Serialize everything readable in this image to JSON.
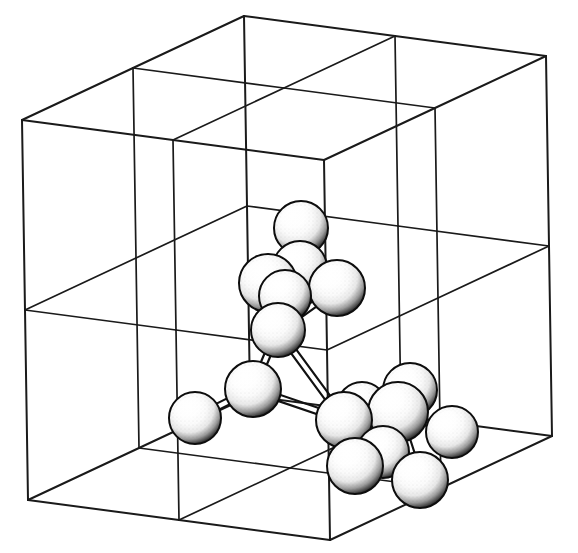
{
  "figure": {
    "kind": "crystal-lattice-illustration",
    "style": "hand-drawn line art, black ink on white",
    "background_color": "#ffffff",
    "ink_color": "#1a1a1a",
    "atom_fill_color": "#ffffff",
    "atom_shade_color": "#1b1b1b",
    "bond_color": "#111111"
  },
  "unit_cell": {
    "name": "subdivided-cube",
    "projection": "oblique-parallel",
    "subdivisions_per_edge": 2,
    "edge_stroke_width_outer": 2.0,
    "edge_stroke_width_inner": 1.7,
    "vertices": {
      "front_bottom_left": [
        28,
        500
      ],
      "front_bottom_right": [
        330,
        540
      ],
      "front_top_left": [
        22,
        120
      ],
      "front_top_right": [
        330,
        168
      ],
      "back_bottom_left": [
        250,
        396
      ],
      "back_bottom_right": [
        556,
        434
      ],
      "back_top_left": [
        248,
        27
      ],
      "back_top_right": [
        556,
        53
      ]
    },
    "axis_vectors": {
      "x_right": [
        302,
        40
      ],
      "y_up": [
        6,
        -380
      ],
      "z_depth": [
        222,
        -104
      ]
    }
  },
  "atoms": {
    "count": 16,
    "radius_px": 27,
    "list": [
      {
        "id": "a1",
        "label": "atom-top",
        "cx": 301,
        "cy": 228,
        "r": 27
      },
      {
        "id": "a2",
        "label": "atom-upper-left",
        "cx": 268,
        "cy": 283,
        "r": 29
      },
      {
        "id": "a3",
        "label": "atom-upper-right",
        "cx": 337,
        "cy": 288,
        "r": 28
      },
      {
        "id": "a4",
        "label": "atom-upper-back",
        "cx": 300,
        "cy": 268,
        "r": 27
      },
      {
        "id": "a5",
        "label": "atom-mid-center",
        "cx": 278,
        "cy": 330,
        "r": 27
      },
      {
        "id": "a6",
        "label": "atom-mid-left",
        "cx": 253,
        "cy": 389,
        "r": 28
      },
      {
        "id": "a7",
        "label": "atom-lower-left",
        "cx": 195,
        "cy": 418,
        "r": 26
      },
      {
        "id": "a8",
        "label": "atom-lower-center",
        "cx": 344,
        "cy": 420,
        "r": 28
      },
      {
        "id": "a9",
        "label": "atom-lower-right",
        "cx": 398,
        "cy": 412,
        "r": 30
      },
      {
        "id": "a10",
        "label": "atom-back-right",
        "cx": 410,
        "cy": 390,
        "r": 27
      },
      {
        "id": "a11",
        "label": "atom-far-right",
        "cx": 452,
        "cy": 432,
        "r": 26
      },
      {
        "id": "a12",
        "label": "atom-bottom-left",
        "cx": 355,
        "cy": 466,
        "r": 28
      },
      {
        "id": "a13",
        "label": "atom-bottom-right",
        "cx": 420,
        "cy": 480,
        "r": 28
      },
      {
        "id": "a14",
        "label": "atom-bottom-back",
        "cx": 383,
        "cy": 452,
        "r": 26
      },
      {
        "id": "a15",
        "label": "atom-upper-left-b",
        "cx": 285,
        "cy": 296,
        "r": 26
      },
      {
        "id": "a16",
        "label": "atom-mid-right-b",
        "cx": 362,
        "cy": 407,
        "r": 25
      }
    ]
  },
  "bonds": {
    "count": 14,
    "stroke_width": 2.2,
    "list": [
      {
        "from": "a1",
        "to": "a2"
      },
      {
        "from": "a1",
        "to": "a3"
      },
      {
        "from": "a1",
        "to": "a4"
      },
      {
        "from": "a2",
        "to": "a5"
      },
      {
        "from": "a3",
        "to": "a5"
      },
      {
        "from": "a4",
        "to": "a5"
      },
      {
        "from": "a5",
        "to": "a6"
      },
      {
        "from": "a5",
        "to": "a8"
      },
      {
        "from": "a6",
        "to": "a7"
      },
      {
        "from": "a6",
        "to": "a8"
      },
      {
        "from": "a8",
        "to": "a9"
      },
      {
        "from": "a9",
        "to": "a11"
      },
      {
        "from": "a9",
        "to": "a13"
      },
      {
        "from": "a8",
        "to": "a12"
      }
    ]
  }
}
